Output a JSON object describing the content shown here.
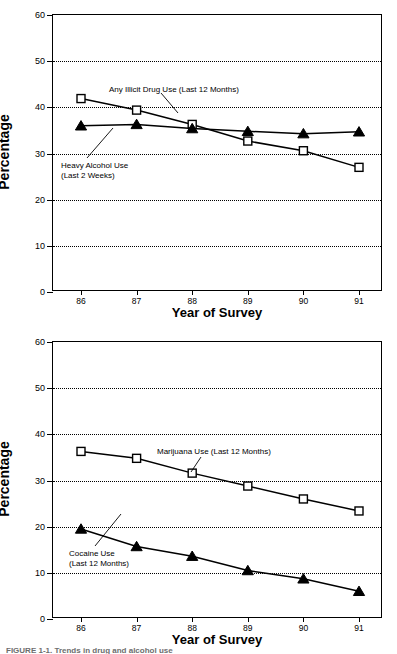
{
  "figure": {
    "caption_partial": "FIGURE 1-1. Trends in drug and alcohol use"
  },
  "chart_data": [
    {
      "type": "line",
      "panel": "top",
      "title": "",
      "xlabel": "Year of Survey",
      "ylabel": "Percentage",
      "categories": [
        "86",
        "87",
        "88",
        "89",
        "90",
        "91"
      ],
      "x": [
        86,
        87,
        88,
        89,
        90,
        91
      ],
      "ylim": [
        0,
        60
      ],
      "yticks": [
        0,
        10,
        20,
        30,
        40,
        50,
        60
      ],
      "grid": "horizontal-dotted",
      "legend": "annotations",
      "series": [
        {
          "name": "Any Illicit Drug Use (Last 12 Months)",
          "marker": "open-square",
          "values": [
            41.9,
            39.4,
            36.3,
            32.7,
            30.6,
            27.0
          ]
        },
        {
          "name": "Heavy Alcohol Use (Last 2 Weeks)",
          "marker": "filled-triangle",
          "values": [
            36.0,
            36.3,
            35.4,
            34.8,
            34.3,
            34.7
          ]
        }
      ],
      "annotations": [
        {
          "text": "Any Illicit Drug Use (Last 12 Months)"
        },
        {
          "text_line1": "Heavy Alcohol Use",
          "text_line2": "(Last 2 Weeks)"
        }
      ]
    },
    {
      "type": "line",
      "panel": "bottom",
      "title": "",
      "xlabel": "Year of Survey",
      "ylabel": "Percentage",
      "categories": [
        "86",
        "87",
        "88",
        "89",
        "90",
        "91"
      ],
      "x": [
        86,
        87,
        88,
        89,
        90,
        91
      ],
      "ylim": [
        0,
        60
      ],
      "yticks": [
        0,
        10,
        20,
        30,
        40,
        50,
        60
      ],
      "grid": "horizontal-dotted",
      "legend": "annotations",
      "series": [
        {
          "name": "Marijuana Use (Last 12 Months)",
          "marker": "open-square",
          "values": [
            36.3,
            34.8,
            31.6,
            28.8,
            26.0,
            23.4
          ]
        },
        {
          "name": "Cocaine Use (Last 12 Months)",
          "marker": "filled-triangle",
          "values": [
            19.5,
            15.7,
            13.6,
            10.5,
            8.7,
            6.0
          ]
        }
      ],
      "annotations": [
        {
          "text": "Marijuana Use (Last 12 Months)"
        },
        {
          "text_line1": "Cocaine Use",
          "text_line2": "(Last 12 Months)"
        }
      ]
    }
  ],
  "top": {
    "ylabel": "Percentage",
    "xlabel": "Year of Survey",
    "yticks": [
      "60",
      "50",
      "40",
      "30",
      "20",
      "10",
      "0"
    ],
    "xticks": [
      "86",
      "87",
      "88",
      "89",
      "90",
      "91"
    ],
    "annot_illicit": "Any Illicit Drug Use (Last 12 Months)",
    "annot_alcohol_1": "Heavy Alcohol Use",
    "annot_alcohol_2": "(Last 2 Weeks)"
  },
  "bottom": {
    "ylabel": "Percentage",
    "xlabel": "Year of Survey",
    "yticks": [
      "60",
      "50",
      "40",
      "30",
      "20",
      "10",
      "0"
    ],
    "xticks": [
      "86",
      "87",
      "88",
      "89",
      "90",
      "91"
    ],
    "annot_marijuana": "Marijuana Use (Last 12 Months)",
    "annot_cocaine_1": "Cocaine Use",
    "annot_cocaine_2": "(Last 12 Months)"
  }
}
